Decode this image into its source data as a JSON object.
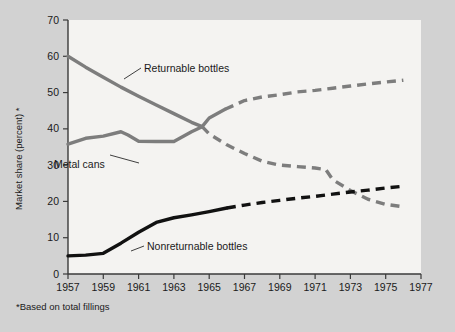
{
  "chart_data": {
    "type": "line",
    "title": "",
    "xlabel": "",
    "ylabel": "Market share (percent) *",
    "footnote": "*Based on total fillings",
    "xlim": [
      1957,
      1977
    ],
    "ylim": [
      0,
      70
    ],
    "grid": false,
    "legend_position": "inline-annotations",
    "xticks": [
      "1957",
      "1959",
      "1961",
      "1963",
      "1965",
      "1967",
      "1969",
      "1971",
      "1973",
      "1975",
      "1977"
    ],
    "xtick_values": [
      1957,
      1959,
      1961,
      1963,
      1965,
      1967,
      1969,
      1971,
      1973,
      1975,
      1977
    ],
    "yticks": [
      "0",
      "10",
      "20",
      "30",
      "40",
      "50",
      "60",
      "70"
    ],
    "ytick_values": [
      0,
      10,
      20,
      30,
      40,
      50,
      60,
      70
    ],
    "series": [
      {
        "name": "Returnable bottles",
        "color": "#7d7d7d",
        "solid_until": 1964.6,
        "x": [
          1957,
          1958,
          1959,
          1960,
          1961,
          1962,
          1963,
          1964,
          1964.6,
          1965,
          1966,
          1967,
          1968,
          1969,
          1970,
          1971,
          1971.6,
          1972,
          1973,
          1974,
          1975,
          1976
        ],
        "values": [
          60.0,
          57.0,
          54.2,
          51.5,
          49.0,
          46.6,
          44.2,
          41.8,
          40.6,
          38.6,
          35.6,
          33.2,
          31.1,
          30.0,
          29.6,
          29.2,
          28.8,
          26.0,
          23.0,
          20.6,
          19.2,
          18.5
        ]
      },
      {
        "name": "Metal cans",
        "color": "#7d7d7d",
        "solid_until": 1965.9,
        "x": [
          1957,
          1958,
          1959,
          1960,
          1960.4,
          1961,
          1962,
          1963,
          1964,
          1964.6,
          1965,
          1965.9,
          1967,
          1968,
          1969,
          1970,
          1971,
          1972,
          1973,
          1974,
          1975,
          1976
        ],
        "values": [
          35.8,
          37.4,
          38.0,
          39.2,
          38.3,
          36.6,
          36.5,
          36.5,
          39.2,
          40.6,
          43.0,
          45.4,
          47.8,
          48.8,
          49.4,
          50.2,
          50.6,
          51.2,
          51.8,
          52.4,
          52.9,
          53.4
        ]
      },
      {
        "name": "Nonreturnable bottles",
        "color": "#111111",
        "solid_until": 1966.0,
        "x": [
          1957,
          1958,
          1959,
          1960,
          1961,
          1962,
          1963,
          1964,
          1965,
          1966,
          1967,
          1968,
          1969,
          1970,
          1971,
          1972,
          1973,
          1974,
          1975,
          1976
        ],
        "values": [
          5.0,
          5.2,
          5.7,
          8.5,
          11.5,
          14.2,
          15.5,
          16.3,
          17.2,
          18.2,
          19.0,
          19.7,
          20.3,
          20.9,
          21.4,
          22.0,
          22.6,
          23.1,
          23.7,
          24.2
        ]
      }
    ],
    "annotations": [
      {
        "text": "Returnable bottles",
        "series": "Returnable bottles"
      },
      {
        "text": "Metal cans",
        "series": "Metal cans"
      },
      {
        "text": "Nonreturnable bottles",
        "series": "Nonreturnable bottles"
      }
    ]
  }
}
